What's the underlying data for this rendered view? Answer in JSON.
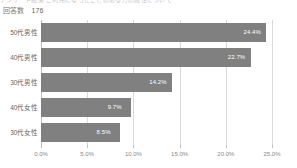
{
  "cut_title": "アンケート結果 ご利用になったことのある方の属性について",
  "header": {
    "response_label": "回答数",
    "response_count": "176"
  },
  "chart_data": {
    "type": "bar",
    "orientation": "horizontal",
    "title": "",
    "xlabel": "",
    "ylabel": "",
    "categories": [
      "50代男性",
      "40代男性",
      "30代男性",
      "40代女性",
      "30代女性"
    ],
    "values": [
      24.4,
      22.7,
      14.2,
      9.7,
      8.5
    ],
    "value_labels": [
      "24.4%",
      "22.7%",
      "14.2%",
      "9.7%",
      "8.5%"
    ],
    "xlim": [
      0.0,
      25.0
    ],
    "xticks": [
      0.0,
      5.0,
      10.0,
      15.0,
      20.0,
      25.0
    ],
    "xtick_labels": [
      "0.0%",
      "5.0%",
      "10.0%",
      "15.0%",
      "20.0%",
      "25.0%"
    ],
    "grid": true,
    "legend": false,
    "bar_color": "#808080",
    "grid_color": "#d9d9d9",
    "label_color": "#ffffff"
  }
}
